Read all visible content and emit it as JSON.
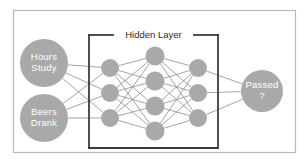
{
  "figure": {
    "title": "Hidden Layer",
    "background_color": "#ffffff",
    "frame_color": "#b9b9b9",
    "bracket_color": "#3b3b3b",
    "node_fill": "#a9a9a9",
    "node_text_color": "#ffffff",
    "edge_color": "#7d7d7d"
  },
  "chart_data": {
    "type": "diagram",
    "title": "Hidden Layer",
    "layers": [
      {
        "name": "input-layer",
        "nodes": [
          {
            "id": "in-1",
            "line1": "Hours",
            "line2": "Study",
            "cx": 44,
            "cy": 63,
            "r": 24
          },
          {
            "id": "in-2",
            "line1": "Beers",
            "line2": "Drank",
            "cx": 44,
            "cy": 118,
            "r": 24
          }
        ]
      },
      {
        "name": "hidden-layer-1",
        "nodes": [
          {
            "id": "h1-1",
            "line1": "",
            "line2": "",
            "cx": 110,
            "cy": 68,
            "r": 9
          },
          {
            "id": "h1-2",
            "line1": "",
            "line2": "",
            "cx": 110,
            "cy": 93,
            "r": 9
          },
          {
            "id": "h1-3",
            "line1": "",
            "line2": "",
            "cx": 110,
            "cy": 118,
            "r": 9
          }
        ]
      },
      {
        "name": "hidden-layer-2",
        "nodes": [
          {
            "id": "h2-1",
            "line1": "",
            "line2": "",
            "cx": 155,
            "cy": 56,
            "r": 9.5
          },
          {
            "id": "h2-2",
            "line1": "",
            "line2": "",
            "cx": 155,
            "cy": 81,
            "r": 9.5
          },
          {
            "id": "h2-3",
            "line1": "",
            "line2": "",
            "cx": 155,
            "cy": 106,
            "r": 9.5
          },
          {
            "id": "h2-4",
            "line1": "",
            "line2": "",
            "cx": 155,
            "cy": 131,
            "r": 9.5
          }
        ]
      },
      {
        "name": "hidden-layer-3",
        "nodes": [
          {
            "id": "h3-1",
            "line1": "",
            "line2": "",
            "cx": 198,
            "cy": 68,
            "r": 9
          },
          {
            "id": "h3-2",
            "line1": "",
            "line2": "",
            "cx": 198,
            "cy": 93,
            "r": 9
          },
          {
            "id": "h3-3",
            "line1": "",
            "line2": "",
            "cx": 198,
            "cy": 118,
            "r": 9
          }
        ]
      },
      {
        "name": "output-layer",
        "nodes": [
          {
            "id": "out-1",
            "line1": "Passed",
            "line2": "?",
            "cx": 262,
            "cy": 91,
            "r": 21
          }
        ]
      }
    ],
    "fully_connected": true,
    "bracket": {
      "x1": 89,
      "y1": 35,
      "x2": 218,
      "y2": 148,
      "title_gap_start": 113,
      "title_gap_end": 194
    },
    "frame": {
      "x": 13,
      "y": 10,
      "width": 282,
      "height": 142
    }
  }
}
